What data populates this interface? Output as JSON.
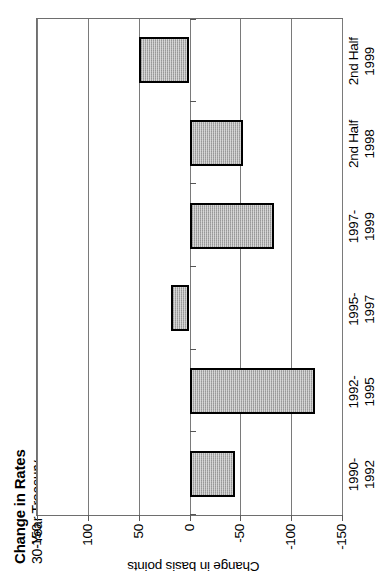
{
  "chart_data": {
    "type": "bar",
    "title": "Change in Rates",
    "subtitle": "30-Year Treasury",
    "xlabel": "",
    "ylabel": "Change in basis points",
    "ylim": [
      -150,
      150
    ],
    "yticks": [
      -150,
      -100,
      -50,
      0,
      50,
      100,
      150
    ],
    "ytick_labels": [
      "-150",
      "-100",
      "-50",
      "0",
      "50",
      "100",
      "150"
    ],
    "grid": true,
    "legend": "none",
    "orientation": "vertical-bars",
    "bar_fill_color": "#a9a9a9",
    "bar_border_color": "#000000",
    "axis_color": "#7a7a7a",
    "categories": [
      "1990-1992",
      "1992-1995",
      "1995-1997",
      "1997-1999",
      "2nd Half 1998",
      "2nd Half 1999"
    ],
    "category_lines": [
      [
        "1990-",
        "1992"
      ],
      [
        "1992-",
        "1995"
      ],
      [
        "1995-",
        "1997"
      ],
      [
        "1997-",
        "1999"
      ],
      [
        "2nd Half",
        "1998"
      ],
      [
        "2nd Half",
        "1999"
      ]
    ],
    "values": [
      -45,
      -123,
      18,
      -83,
      -53,
      50
    ],
    "units": "basis points"
  }
}
